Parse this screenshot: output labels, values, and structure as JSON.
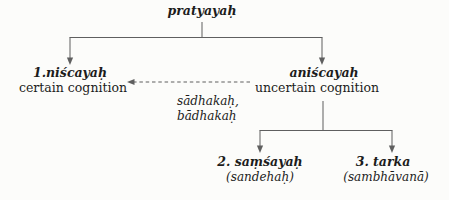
{
  "colors": {
    "background": "#fcfcfa",
    "line": "#5f5f5f",
    "text": "#1c1c1c"
  },
  "diagram": {
    "title_node": {
      "term": "pratyayaḥ"
    },
    "certain": {
      "term": "1.niścayaḥ",
      "gloss": "certain cognition"
    },
    "uncertain": {
      "term": "aniścayaḥ",
      "gloss": "uncertain cognition"
    },
    "dashed_arrow_label": {
      "line1": "sādhakaḥ,",
      "line2": "bādhakaḥ"
    },
    "doubt": {
      "term": "2. saṃśayaḥ",
      "gloss": "(sandehaḥ)"
    },
    "tarka": {
      "term": "3. tarka",
      "gloss": "(sambhāvanā)"
    }
  }
}
